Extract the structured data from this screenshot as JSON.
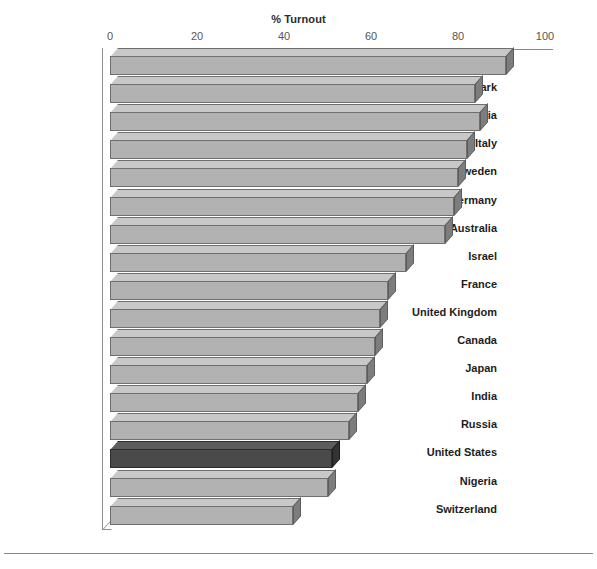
{
  "chart_data": {
    "type": "bar",
    "orientation": "horizontal",
    "title": "% Turnout",
    "xlabel": "% Turnout",
    "ylabel": "",
    "xlim": [
      0,
      100
    ],
    "xticks": [
      0,
      20,
      40,
      60,
      80,
      100
    ],
    "xtick_labels": [
      "0",
      "20",
      "40",
      "60",
      "80",
      "100"
    ],
    "grid": false,
    "legend": false,
    "categories": [
      "Belgium",
      "Denmark",
      "Austria",
      "Italy",
      "Sweden",
      "Germany",
      "Australia",
      "Israel",
      "France",
      "United Kingdom",
      "Canada",
      "Japan",
      "India",
      "Russia",
      "United States",
      "Nigeria",
      "Switzerland"
    ],
    "values": [
      91,
      84,
      85,
      82,
      80,
      79,
      77,
      68,
      64,
      62,
      61,
      59,
      57,
      55,
      51,
      50,
      42
    ],
    "highlight_category": "United States",
    "colors": {
      "bar_front": "#b2b2b2",
      "bar_top": "#c8c8c8",
      "bar_side": "#7d7d7d",
      "bar_edge": "#6f6f6f",
      "highlight_front": "#4a4a4a",
      "highlight_top": "#5d5d5d",
      "highlight_side": "#333333",
      "axis": "#8a8a8a",
      "text": "#1d1d1d",
      "background": "#ffffff"
    }
  }
}
